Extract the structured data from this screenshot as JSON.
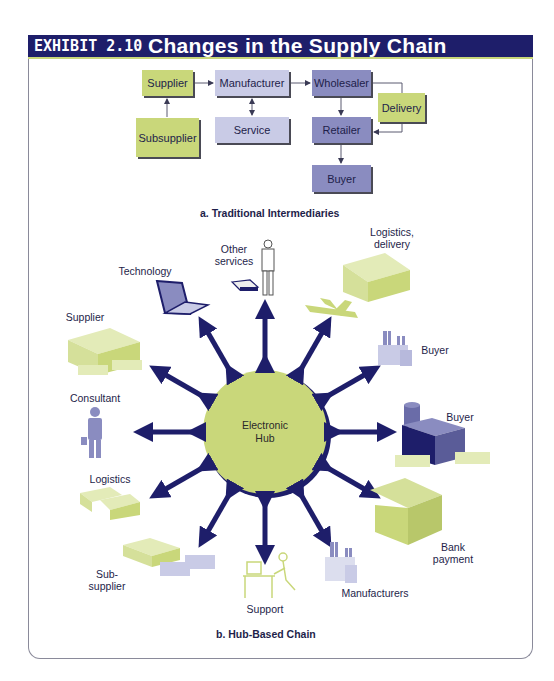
{
  "header": {
    "exhibit": "EXHIBIT 2.10",
    "title": "Changes in the Supply Chain"
  },
  "traditional": {
    "caption": "a. Traditional Intermediaries",
    "boxes": {
      "supplier": "Supplier",
      "manufacturer": "Manufacturer",
      "wholesaler": "Wholesaler",
      "delivery": "Delivery",
      "subsupplier": "Subsupplier",
      "service": "Service",
      "retailer": "Retailer",
      "buyer": "Buyer"
    }
  },
  "hub": {
    "caption": "b. Hub-Based Chain",
    "center_line1": "Electronic",
    "center_line2": "Hub",
    "nodes": {
      "other_services_1": "Other",
      "other_services_2": "services",
      "technology": "Technology",
      "logistics_delivery_1": "Logistics,",
      "logistics_delivery_2": "delivery",
      "supplier": "Supplier",
      "buyer_top": "Buyer",
      "consultant": "Consultant",
      "buyer_right": "Buyer",
      "logistics": "Logistics",
      "bank_1": "Bank",
      "bank_2": "payment",
      "subsupplier_1": "Sub-",
      "subsupplier_2": "supplier",
      "support": "Support",
      "manufacturers": "Manufacturers"
    }
  },
  "colors": {
    "navy": "#1e1e6a",
    "green": "#c9d77a",
    "lavender": "#c9cbe6",
    "blue": "#8a8cc0"
  }
}
